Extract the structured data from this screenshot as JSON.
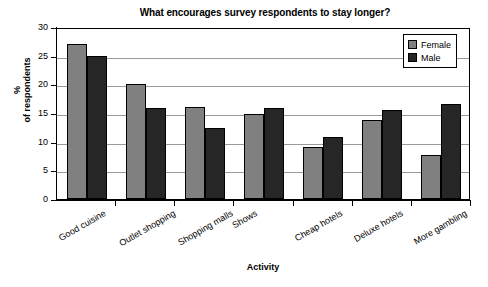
{
  "chart_data": {
    "type": "bar",
    "title": "What encourages survey respondents to stay longer?",
    "xlabel": "Activity",
    "ylabel": "%\nof respondents",
    "ylabel_lines": [
      "%",
      "of respondents"
    ],
    "ylim": [
      0,
      30
    ],
    "yticks": [
      0,
      5,
      10,
      15,
      20,
      25,
      30
    ],
    "ytick_labels": [
      "0",
      "5",
      "10",
      "15",
      "20",
      "25",
      "30"
    ],
    "grid": true,
    "grid_axis": "y",
    "legend_position": "top-right",
    "categories": [
      "Good cuisine",
      "Outlet shopping",
      "Shopping malls",
      "Shows",
      "Cheap hotels",
      "Deluxe hotels",
      "More gambling"
    ],
    "series": [
      {
        "name": "Female",
        "color": "#808080",
        "values": [
          27.0,
          20.0,
          16.0,
          14.8,
          9.0,
          13.8,
          7.7
        ]
      },
      {
        "name": "Male",
        "color": "#262626",
        "values": [
          25.0,
          15.8,
          12.3,
          15.8,
          10.8,
          15.6,
          16.6
        ]
      }
    ]
  },
  "colors": {
    "female": "#808080",
    "male": "#262626",
    "axis": "#000000",
    "grid": "#9a9a9a",
    "background": "#ffffff"
  }
}
